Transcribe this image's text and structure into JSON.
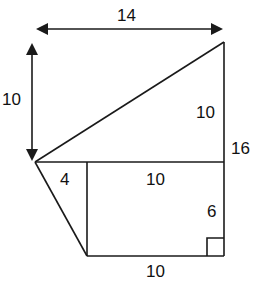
{
  "diagram": {
    "labels": {
      "top_width": "14",
      "left_height": "10",
      "triangle_right_side": "10",
      "total_right_height": "16",
      "small_triangle_base": "4",
      "rectangle_top": "10",
      "rectangle_right": "6",
      "rectangle_bottom": "10"
    },
    "colors": {
      "stroke": "#1a1a1a",
      "background": "#ffffff"
    }
  }
}
